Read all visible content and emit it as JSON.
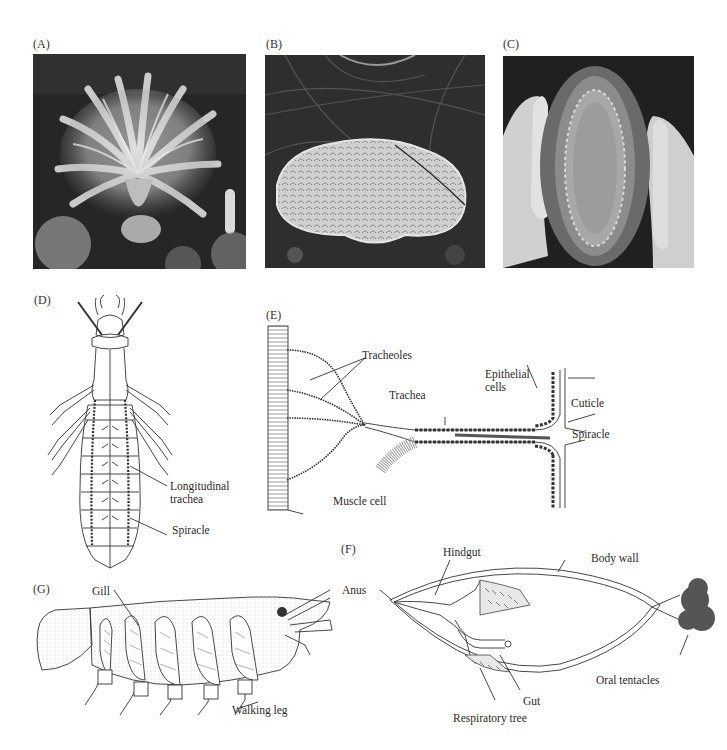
{
  "figure": {
    "panels": [
      {
        "id": "A",
        "label": "(A)",
        "type": "photo",
        "subject": "feathery tentacle crown (grayscale photograph)"
      },
      {
        "id": "B",
        "label": "(B)",
        "type": "photo",
        "subject": "flat oval organism on dark substrate (grayscale photograph)"
      },
      {
        "id": "C",
        "label": "(C)",
        "type": "photo",
        "subject": "elongated animal held between two hands (grayscale photograph)"
      },
      {
        "id": "D",
        "label": "(D)",
        "type": "diagram",
        "subject": "insect larva tracheal system, dorsal view",
        "annotations": [
          "Longitudinal trachea",
          "Spiracle"
        ]
      },
      {
        "id": "E",
        "label": "(E)",
        "type": "diagram",
        "subject": "trachea to muscle cell",
        "annotations": [
          "Tracheoles",
          "Epithelial cells",
          "Trachea",
          "Cuticle",
          "Spiracle",
          "Muscle cell"
        ]
      },
      {
        "id": "F",
        "label": "(F)",
        "type": "diagram",
        "subject": "sea cucumber internal anatomy",
        "annotations": [
          "Hindgut",
          "Body wall",
          "Anus",
          "Gut",
          "Oral tentacles",
          "Respiratory tree"
        ]
      },
      {
        "id": "G",
        "label": "(G)",
        "type": "diagram",
        "subject": "crayfish side view with gills",
        "annotations": [
          "Gill",
          "Walking leg"
        ]
      }
    ]
  },
  "labels": {
    "A": "(A)",
    "B": "(B)",
    "C": "(C)",
    "D": "(D)",
    "E": "(E)",
    "F": "(F)",
    "G": "(G)",
    "d_longitudinal_1": "Longitudinal",
    "d_longitudinal_2": "trachea",
    "d_spiracle": "Spiracle",
    "e_tracheoles": "Tracheoles",
    "e_epithelial_1": "Epithelial",
    "e_epithelial_2": "cells",
    "e_trachea": "Trachea",
    "e_cuticle": "Cuticle",
    "e_spiracle": "Spiracle",
    "e_muscle": "Muscle cell",
    "f_hindgut": "Hindgut",
    "f_bodywall": "Body wall",
    "f_anus": "Anus",
    "f_gut": "Gut",
    "f_oral": "Oral tentacles",
    "f_resp": "Respiratory tree",
    "g_gill": "Gill",
    "g_walking": "Walking leg"
  },
  "colors": {
    "background": "#ffffff",
    "line": "#333333",
    "photo_dark": "#1a1a1a",
    "photo_light": "#d8d8d8"
  }
}
